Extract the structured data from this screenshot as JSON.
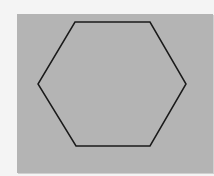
{
  "diagram": {
    "shape": "hexagon",
    "background_color": "#f4f4f4",
    "panel_color": "#b4b4b4",
    "stroke_color": "#1a1a1a",
    "stroke_width": 1.5,
    "points": "75,22 150,22 186,84 150,146 76,146 38,84"
  }
}
